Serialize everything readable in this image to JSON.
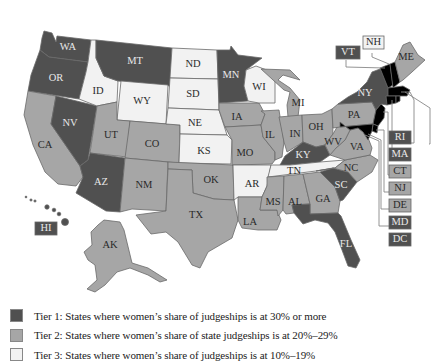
{
  "colors": {
    "tier1": "#505050",
    "tier2": "#a6a6a6",
    "tier3": "#f2f2f2",
    "border": "#6a6a6a",
    "background": "#ffffff"
  },
  "legend": [
    {
      "tier": "tier1",
      "label": "Tier 1: States where women’s share of judgeships is at 30% or more"
    },
    {
      "tier": "tier2",
      "label": "Tier 2: States where women’s share of state judgeships is at 20%–29%"
    },
    {
      "tier": "tier3",
      "label": "Tier 3: States where women’s share of judgeships is at 10%–19%"
    }
  ],
  "states": {
    "WA": {
      "label": "WA",
      "tier": "tier1"
    },
    "OR": {
      "label": "OR",
      "tier": "tier1"
    },
    "CA": {
      "label": "CA",
      "tier": "tier2"
    },
    "NV": {
      "label": "NV",
      "tier": "tier1"
    },
    "ID": {
      "label": "ID",
      "tier": "tier3"
    },
    "MT": {
      "label": "MT",
      "tier": "tier1"
    },
    "WY": {
      "label": "WY",
      "tier": "tier3"
    },
    "UT": {
      "label": "UT",
      "tier": "tier2"
    },
    "AZ": {
      "label": "AZ",
      "tier": "tier1"
    },
    "CO": {
      "label": "CO",
      "tier": "tier2"
    },
    "NM": {
      "label": "NM",
      "tier": "tier2"
    },
    "ND": {
      "label": "ND",
      "tier": "tier3"
    },
    "SD": {
      "label": "SD",
      "tier": "tier3"
    },
    "NE": {
      "label": "NE",
      "tier": "tier3"
    },
    "KS": {
      "label": "KS",
      "tier": "tier3"
    },
    "OK": {
      "label": "OK",
      "tier": "tier2"
    },
    "TX": {
      "label": "TX",
      "tier": "tier2"
    },
    "MN": {
      "label": "MN",
      "tier": "tier1"
    },
    "IA": {
      "label": "IA",
      "tier": "tier2"
    },
    "MO": {
      "label": "MO",
      "tier": "tier2"
    },
    "AR": {
      "label": "AR",
      "tier": "tier3"
    },
    "LA": {
      "label": "LA",
      "tier": "tier2"
    },
    "WI": {
      "label": "WI",
      "tier": "tier3"
    },
    "IL": {
      "label": "IL",
      "tier": "tier2"
    },
    "MI": {
      "label": "MI",
      "tier": "tier2"
    },
    "IN": {
      "label": "IN",
      "tier": "tier2"
    },
    "OH": {
      "label": "OH",
      "tier": "tier2"
    },
    "KY": {
      "label": "KY",
      "tier": "tier1"
    },
    "TN": {
      "label": "TN",
      "tier": "tier3"
    },
    "MS": {
      "label": "MS",
      "tier": "tier2"
    },
    "AL": {
      "label": "AL",
      "tier": "tier2"
    },
    "GA": {
      "label": "GA",
      "tier": "tier2"
    },
    "FL": {
      "label": "FL",
      "tier": "tier1"
    },
    "SC": {
      "label": "SC",
      "tier": "tier1"
    },
    "NC": {
      "label": "NC",
      "tier": "tier2"
    },
    "VA": {
      "label": "VA",
      "tier": "tier2"
    },
    "WV": {
      "label": "WV",
      "tier": "tier2"
    },
    "PA": {
      "label": "PA",
      "tier": "tier2"
    },
    "NY": {
      "label": "NY",
      "tier": "tier1"
    },
    "ME": {
      "label": "ME",
      "tier": "tier2"
    },
    "AK": {
      "label": "AK",
      "tier": "tier2"
    },
    "HI": {
      "label": "HI",
      "tier": "tier1"
    }
  },
  "callouts": {
    "NH": {
      "label": "NH",
      "tier": "tier3"
    },
    "VT": {
      "label": "VT",
      "tier": "tier1"
    },
    "RI": {
      "label": "RI",
      "tier": "tier1"
    },
    "MA": {
      "label": "MA",
      "tier": "tier1"
    },
    "CT": {
      "label": "CT",
      "tier": "tier2"
    },
    "NJ": {
      "label": "NJ",
      "tier": "tier2"
    },
    "DE": {
      "label": "DE",
      "tier": "tier2"
    },
    "MD": {
      "label": "MD",
      "tier": "tier1"
    },
    "DC": {
      "label": "DC",
      "tier": "tier1"
    }
  }
}
